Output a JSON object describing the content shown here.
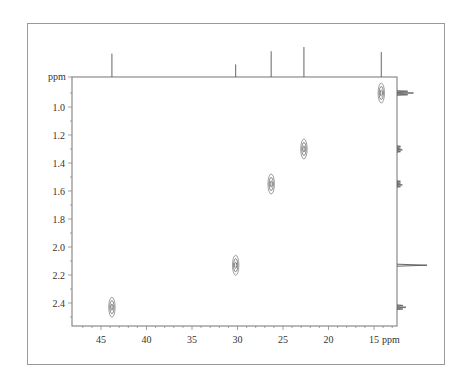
{
  "chart_data": {
    "type": "scatter",
    "title": "",
    "subtitle": "2D HSQC-type heteronuclear correlation spectrum",
    "xlabel": "ppm",
    "ylabel": "ppm",
    "x_axis": {
      "label": "ppm",
      "direction": "reversed",
      "range": [
        48,
        12
      ],
      "ticks": [
        45,
        40,
        35,
        30,
        25,
        20,
        15
      ],
      "tick_labels": [
        "45",
        "40",
        "35",
        "30",
        "25",
        "20",
        "15"
      ]
    },
    "y_axis": {
      "label": "ppm",
      "direction": "downward-increasing",
      "range": [
        0.8,
        2.55
      ],
      "ticks": [
        1.0,
        1.2,
        1.4,
        1.6,
        1.8,
        2.0,
        2.2,
        2.4
      ],
      "tick_labels": [
        "1.0",
        "1.2",
        "1.4",
        "1.6",
        "1.8",
        "2.0",
        "2.2",
        "2.4"
      ]
    },
    "grid": false,
    "legend": null,
    "cross_peaks": [
      {
        "x_ppm": 43.8,
        "y_ppm": 2.43
      },
      {
        "x_ppm": 30.2,
        "y_ppm": 2.13
      },
      {
        "x_ppm": 26.3,
        "y_ppm": 1.55
      },
      {
        "x_ppm": 22.7,
        "y_ppm": 1.3
      },
      {
        "x_ppm": 14.2,
        "y_ppm": 0.9
      }
    ],
    "top_projection": {
      "axis": "x",
      "peaks": [
        {
          "ppm": 43.8,
          "relative_height": 0.78
        },
        {
          "ppm": 30.2,
          "relative_height": 0.42
        },
        {
          "ppm": 26.3,
          "relative_height": 0.86
        },
        {
          "ppm": 22.7,
          "relative_height": 1.0
        },
        {
          "ppm": 14.2,
          "relative_height": 0.83
        }
      ]
    },
    "right_projection": {
      "axis": "y",
      "peaks": [
        {
          "ppm": 0.9,
          "relative_height": 0.55,
          "shape": "triplet"
        },
        {
          "ppm": 1.3,
          "relative_height": 0.18,
          "shape": "multiplet"
        },
        {
          "ppm": 1.55,
          "relative_height": 0.18,
          "shape": "multiplet"
        },
        {
          "ppm": 2.13,
          "relative_height": 1.0,
          "shape": "singlet"
        },
        {
          "ppm": 2.43,
          "relative_height": 0.3,
          "shape": "triplet"
        }
      ]
    }
  },
  "labels": {
    "y_unit": "ppm",
    "x_unit": "ppm"
  },
  "colors": {
    "axis": "#8a8a8a",
    "text": "#333333",
    "contour": "#555555",
    "frame": "#9a9a9a"
  }
}
